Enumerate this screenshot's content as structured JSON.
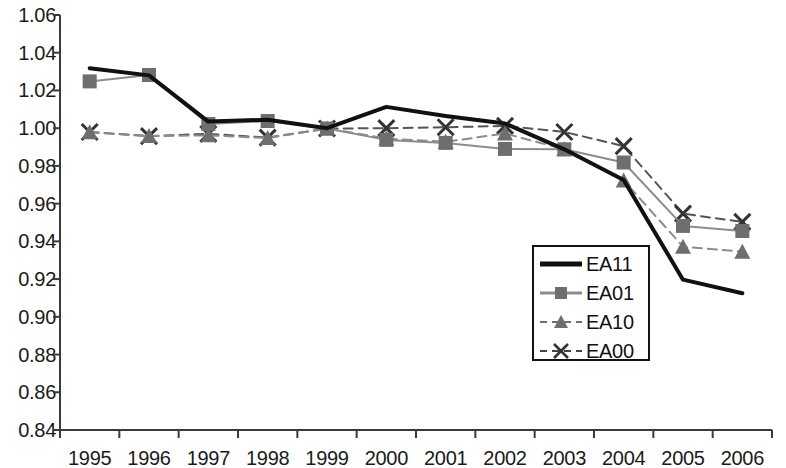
{
  "chart_data": {
    "type": "line",
    "title": "",
    "subtitle": "",
    "xlabel": "",
    "ylabel": "",
    "grid": false,
    "legend_position": "inside-bottom-right",
    "categories": [
      "1995",
      "1996",
      "1997",
      "1998",
      "1999",
      "2000",
      "2001",
      "2002",
      "2003",
      "2004",
      "2005",
      "2006"
    ],
    "x": [
      1995,
      1996,
      1997,
      1998,
      1999,
      2000,
      2001,
      2002,
      2003,
      2004,
      2005,
      2006
    ],
    "xlim": [
      1995,
      2006
    ],
    "ylim": [
      0.84,
      1.06
    ],
    "ytick_labels": [
      "1.06",
      "1.04",
      "1.02",
      "1.00",
      "0.98",
      "0.96",
      "0.94",
      "0.92",
      "0.90",
      "0.88",
      "0.86",
      "0.84"
    ],
    "ytick_values": [
      1.06,
      1.04,
      1.02,
      1.0,
      0.98,
      0.96,
      0.94,
      0.92,
      0.9,
      0.88,
      0.86,
      0.84
    ],
    "ytick_step": 0.02,
    "series": [
      {
        "name": "EA11",
        "color": "#111111",
        "line_style": "solid",
        "marker": "none",
        "line_width": 4,
        "values": [
          1.0318,
          1.028,
          1.0035,
          1.0045,
          1.0,
          1.0113,
          1.0065,
          1.0025,
          0.9888,
          0.9725,
          0.9197,
          0.9125
        ]
      },
      {
        "name": "EA01",
        "color": "#8c8c8c",
        "line_style": "solid",
        "marker": "square",
        "line_width": 2,
        "values": [
          1.0248,
          1.0282,
          1.0022,
          1.0038,
          0.9998,
          0.9938,
          0.9922,
          0.989,
          0.9888,
          0.9818,
          0.9482,
          0.9455
        ]
      },
      {
        "name": "EA10",
        "color": "#8c8c8c",
        "line_style": "dashed",
        "marker": "triangle",
        "line_width": 2,
        "values": [
          0.9978,
          0.9958,
          0.9962,
          0.9948,
          0.9998,
          0.9945,
          0.9928,
          0.9972,
          0.9888,
          0.9723,
          0.9372,
          0.9345
        ]
      },
      {
        "name": "EA00",
        "color": "#555555",
        "line_style": "dashed",
        "marker": "cross",
        "line_width": 2,
        "values": [
          0.998,
          0.9958,
          0.997,
          0.995,
          0.9998,
          1.0,
          1.0005,
          1.0012,
          0.998,
          0.9905,
          0.9547,
          0.9503
        ]
      }
    ]
  },
  "legend": {
    "items": [
      {
        "label": "EA11"
      },
      {
        "label": "EA01"
      },
      {
        "label": "EA10"
      },
      {
        "label": "EA00"
      }
    ]
  }
}
